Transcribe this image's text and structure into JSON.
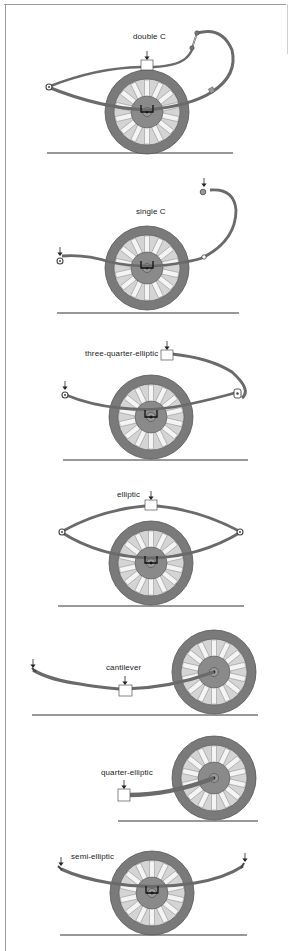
{
  "figure": {
    "colors": {
      "tyre": "#7a7a7a",
      "tyre_edge": "#555555",
      "felloe": "#d9d9d9",
      "spoke": "#f2f2f2",
      "hub": "#8a8a8a",
      "spring": "#6a6a6a",
      "spring_edge": "#444444",
      "ground": "#333333",
      "box": "#ffffff",
      "arrow": "#222222",
      "frame": "#9a9a9a"
    },
    "panels": [
      {
        "id": "double-c",
        "label": "double C"
      },
      {
        "id": "single-c",
        "label": "single C"
      },
      {
        "id": "three-quarter-elliptic",
        "label": "three-quarter-elliptic"
      },
      {
        "id": "elliptic",
        "label": "elliptic"
      },
      {
        "id": "cantilever",
        "label": "cantilever"
      },
      {
        "id": "quarter-elliptic",
        "label": "quarter-elliptic"
      },
      {
        "id": "semi-elliptic",
        "label": "semi-elliptic"
      }
    ]
  }
}
